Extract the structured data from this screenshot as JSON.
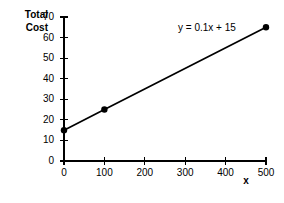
{
  "chart_data": {
    "type": "line",
    "title": "",
    "subtitle": "",
    "ylabel_line1": "Total",
    "ylabel_line2": "Cost",
    "xlabel": "x",
    "xlim": [
      0,
      500
    ],
    "ylim": [
      0,
      70
    ],
    "grid": false,
    "legend_position": "none",
    "x_ticks": [
      0,
      100,
      200,
      300,
      400,
      500
    ],
    "x_tick_labels": [
      "0",
      "100",
      "200",
      "300",
      "400",
      "500"
    ],
    "y_ticks": [
      0,
      10,
      20,
      30,
      40,
      50,
      60,
      70
    ],
    "y_tick_labels": [
      "0",
      "10",
      "20",
      "30",
      "40",
      "50",
      "60",
      "70"
    ],
    "series": [
      {
        "name": "Total Cost",
        "x": [
          0,
          100,
          500
        ],
        "values": [
          15,
          25,
          65
        ],
        "color": "#000000",
        "marker": "circle"
      }
    ],
    "annotations": [
      {
        "name": "line-equation",
        "text": "y = 0.1x + 15",
        "x": 300,
        "y": 62
      }
    ]
  }
}
